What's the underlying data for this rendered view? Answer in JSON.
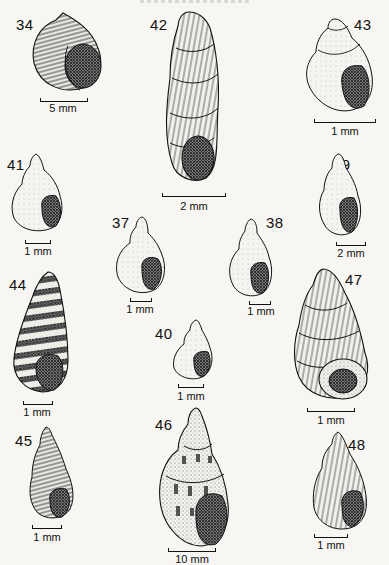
{
  "plate": {
    "description": "Illustration plate of gastropod shells",
    "figures": [
      {
        "id": "34",
        "label": "34",
        "scale": "5 mm"
      },
      {
        "id": "42",
        "label": "42",
        "scale": "2 mm"
      },
      {
        "id": "43",
        "label": "43",
        "scale": "1 mm"
      },
      {
        "id": "41",
        "label": "41",
        "scale": "1 mm"
      },
      {
        "id": "39",
        "label": "39",
        "scale": "2 mm"
      },
      {
        "id": "37",
        "label": "37",
        "scale": "1 mm"
      },
      {
        "id": "38",
        "label": "38",
        "scale": "1 mm"
      },
      {
        "id": "44",
        "label": "44",
        "scale": "1 mm"
      },
      {
        "id": "47",
        "label": "47",
        "scale": "1 mm"
      },
      {
        "id": "40",
        "label": "40",
        "scale": "1 mm"
      },
      {
        "id": "45",
        "label": "45",
        "scale": "1 mm"
      },
      {
        "id": "46",
        "label": "46",
        "scale": "10 mm"
      },
      {
        "id": "48",
        "label": "48",
        "scale": "1 mm"
      }
    ]
  },
  "colors": {
    "ink": "#111111",
    "paper": "#f7f6f2"
  }
}
